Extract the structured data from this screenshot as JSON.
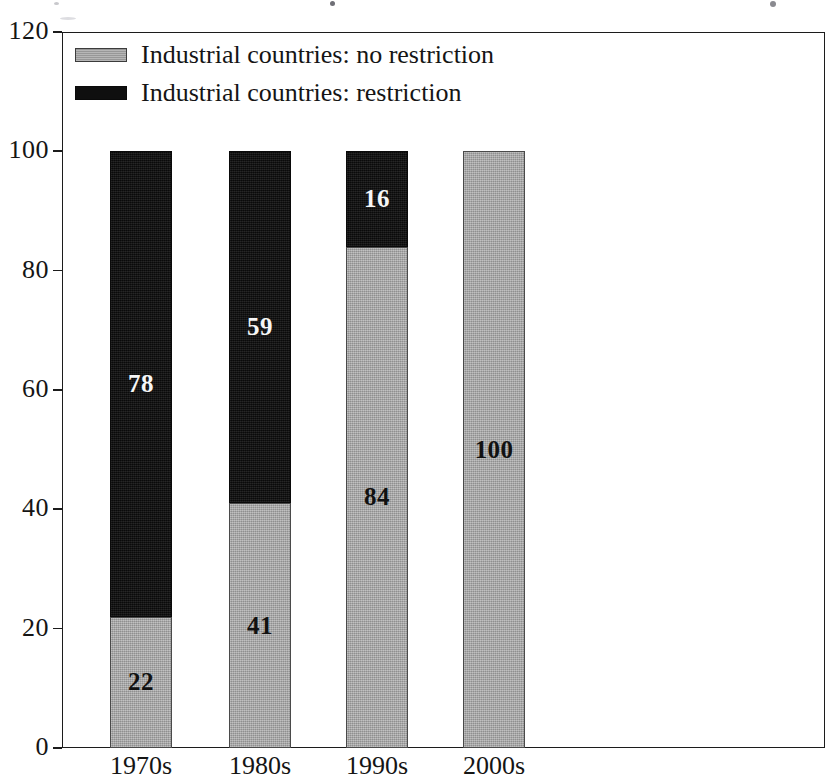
{
  "chart_data": {
    "type": "bar",
    "subtype": "stacked-bar-100",
    "title": "",
    "xlabel": "",
    "ylabel": "",
    "categories": [
      "1970s",
      "1980s",
      "1990s",
      "2000s"
    ],
    "series": [
      {
        "name": "Industrial countries: no restriction",
        "color": "#a4a4a4",
        "values": [
          22,
          41,
          84,
          100
        ],
        "labels": [
          "22",
          "41",
          "84",
          "100"
        ],
        "label_color": "#111111"
      },
      {
        "name": "Industrial countries: restriction",
        "color": "#111111",
        "values": [
          78,
          59,
          16,
          0
        ],
        "labels": [
          "78",
          "59",
          "16",
          ""
        ],
        "label_color": "#f6f6f6"
      }
    ],
    "ylim": [
      0,
      120
    ],
    "yticks": [
      0,
      20,
      40,
      60,
      80,
      100,
      120
    ],
    "ytick_labels": [
      "0",
      "20",
      "40",
      "60",
      "80",
      "100",
      "120"
    ],
    "grid": false,
    "legend_position": "top-left",
    "stack_order": [
      "Industrial countries: no restriction",
      "Industrial countries: restriction"
    ]
  },
  "legend": {
    "items": [
      {
        "label": "Industrial countries: no restriction",
        "swatch": "gray"
      },
      {
        "label": "Industrial countries: restriction",
        "swatch": "black"
      }
    ]
  },
  "axes": {
    "y_ticks": [
      "0",
      "20",
      "40",
      "60",
      "80",
      "100",
      "120"
    ],
    "x_ticks": [
      "1970s",
      "1980s",
      "1990s",
      "2000s"
    ]
  }
}
